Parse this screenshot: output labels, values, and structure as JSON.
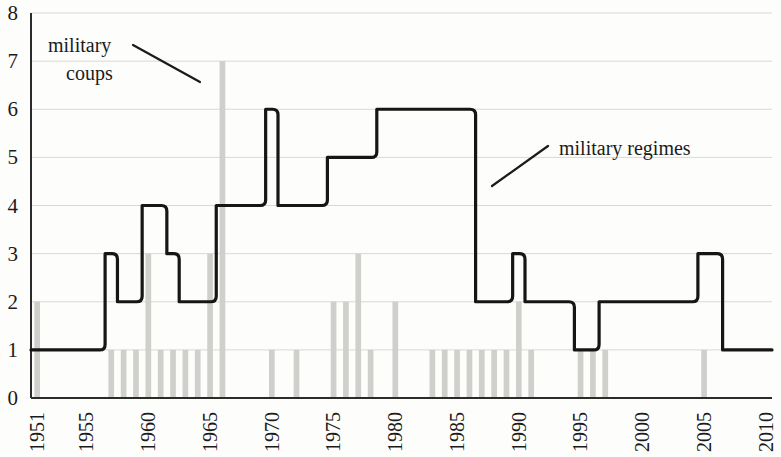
{
  "chart_data": {
    "type": "bar",
    "title": "",
    "subtitle": "",
    "xlabel": "",
    "ylabel": "",
    "xlim": [
      1950.5,
      2010.5
    ],
    "ylim": [
      0,
      8
    ],
    "grid": true,
    "legend_position": "none",
    "x_tick_labels": [
      "1951",
      "1955",
      "1960",
      "1965",
      "1970",
      "1975",
      "1980",
      "1985",
      "1990",
      "1995",
      "2000",
      "2005",
      "2010"
    ],
    "x_tick_values": [
      1951,
      1955,
      1960,
      1965,
      1970,
      1975,
      1980,
      1985,
      1990,
      1995,
      2000,
      2005,
      2010
    ],
    "y_tick_labels": [
      "0",
      "1",
      "2",
      "3",
      "4",
      "5",
      "6",
      "7",
      "8"
    ],
    "y_tick_values": [
      0,
      1,
      2,
      3,
      4,
      5,
      6,
      7,
      8
    ],
    "x": [
      1951,
      1952,
      1953,
      1954,
      1955,
      1956,
      1957,
      1958,
      1959,
      1960,
      1961,
      1962,
      1963,
      1964,
      1965,
      1966,
      1967,
      1968,
      1969,
      1970,
      1971,
      1972,
      1973,
      1974,
      1975,
      1976,
      1977,
      1978,
      1979,
      1980,
      1981,
      1982,
      1983,
      1984,
      1985,
      1986,
      1987,
      1988,
      1989,
      1990,
      1991,
      1992,
      1993,
      1994,
      1995,
      1996,
      1997,
      1998,
      1999,
      2000,
      2001,
      2002,
      2003,
      2004,
      2005,
      2006,
      2007,
      2008,
      2009,
      2010
    ],
    "series": [
      {
        "name": "military coups",
        "type": "bar",
        "color": "#cfcfcb",
        "values": [
          2,
          0,
          0,
          0,
          0,
          0,
          1,
          1,
          1,
          3,
          1,
          1,
          1,
          1,
          3,
          7,
          0,
          0,
          0,
          1,
          0,
          1,
          0,
          0,
          2,
          2,
          3,
          1,
          0,
          2,
          0,
          0,
          1,
          1,
          1,
          1,
          1,
          1,
          1,
          2,
          1,
          0,
          0,
          0,
          1,
          1,
          1,
          0,
          0,
          0,
          0,
          0,
          0,
          0,
          1,
          0,
          0,
          0,
          0,
          0
        ]
      },
      {
        "name": "military regimes",
        "type": "line",
        "color": "#161616",
        "values": [
          1,
          1,
          1,
          1,
          1,
          1,
          3,
          2,
          2,
          4,
          4,
          3,
          2,
          2,
          2,
          4,
          4,
          4,
          4,
          6,
          4,
          4,
          4,
          4,
          5,
          5,
          5,
          5,
          6,
          6,
          6,
          6,
          6,
          6,
          6,
          6,
          2,
          2,
          2,
          3,
          2,
          2,
          2,
          2,
          1,
          1,
          2,
          2,
          2,
          2,
          2,
          2,
          2,
          2,
          3,
          3,
          1,
          1,
          1,
          1
        ]
      }
    ]
  },
  "annotations": [
    {
      "id": "coups-annotation",
      "line1": "military",
      "line2": "coups",
      "text": "military coups",
      "x": 1953.5,
      "y": 7.5
    },
    {
      "id": "regimes-annotation",
      "line1": "military regimes",
      "line2": "",
      "text": "military regimes",
      "x": 1996,
      "y": 5.4
    }
  ]
}
